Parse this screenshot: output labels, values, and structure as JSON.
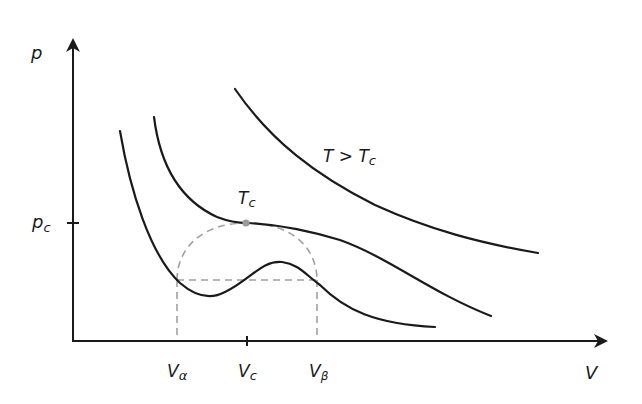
{
  "diagram": {
    "axes": {
      "y_label": "p",
      "x_label": "V",
      "y_tick_label": {
        "main": "p",
        "sub": "c"
      }
    },
    "x_ticks": [
      {
        "main": "V",
        "sub": "α"
      },
      {
        "main": "V",
        "sub": "c"
      },
      {
        "main": "V",
        "sub": "β"
      }
    ],
    "curves": [
      {
        "id": "below-critical",
        "label": ""
      },
      {
        "id": "critical",
        "label_main": "T",
        "label_sub": "c"
      },
      {
        "id": "above-critical",
        "label_main": "T > T",
        "label_sub": "c"
      }
    ],
    "colors": {
      "curve": "#1a1a1a",
      "axis": "#1a1a1a",
      "dashed": "#a0a0a0",
      "critical_point": "#9a9a9a"
    }
  }
}
